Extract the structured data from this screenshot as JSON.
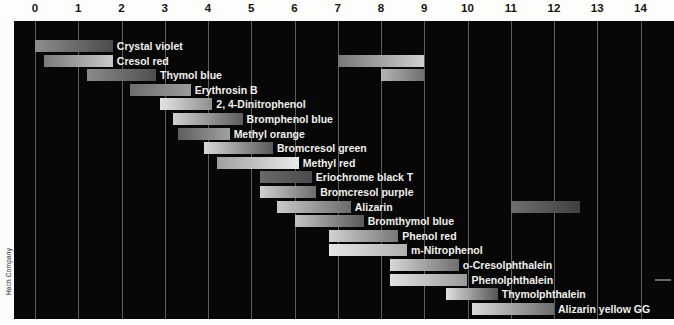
{
  "chart_data": {
    "type": "bar",
    "title": "",
    "xlabel": "pH",
    "ylabel": "",
    "xlim": [
      0,
      14.6
    ],
    "grid": true,
    "legend": false,
    "orientation": "horizontal",
    "tick_labels": [
      "0",
      "1",
      "2",
      "3",
      "4",
      "5",
      "6",
      "7",
      "8",
      "9",
      "10",
      "11",
      "12",
      "13",
      "14"
    ],
    "ticks": [
      0,
      1,
      2,
      3,
      4,
      5,
      6,
      7,
      8,
      9,
      10,
      11,
      12,
      13,
      14
    ],
    "categories": [
      "Crystal violet",
      "Cresol red",
      "Thymol blue",
      "Erythrosin B",
      "2, 4-Dinitrophenol",
      "Bromphenol blue",
      "Methyl orange",
      "Bromcresol green",
      "Methyl red",
      "Eriochrome black T",
      "Bromcresol purple",
      "Alizarin",
      "Bromthymol blue",
      "Phenol red",
      "m-Nitrophenol",
      "o-Cresolphthalein",
      "Phenolphthalein",
      "Thymolphthalein",
      "Alizarin yellow GG"
    ],
    "series": [
      {
        "name": "Crystal violet",
        "ranges": [
          [
            0.0,
            1.8
          ]
        ],
        "colors": [
          [
            "#8d8d8d",
            "#4b4b4b"
          ]
        ]
      },
      {
        "name": "Cresol red",
        "ranges": [
          [
            0.2,
            1.8
          ],
          [
            7.0,
            9.0
          ]
        ],
        "colors": [
          [
            "#7a7a7a",
            "#c9c9c9"
          ],
          [
            "#777777",
            "#cfcfcf"
          ]
        ]
      },
      {
        "name": "Thymol blue",
        "ranges": [
          [
            1.2,
            2.8
          ],
          [
            8.0,
            9.0
          ]
        ],
        "colors": [
          [
            "#8b8b8b",
            "#4f4f4f"
          ],
          [
            "#b5b5b5",
            "#6f6f6f"
          ]
        ]
      },
      {
        "name": "Erythrosin B",
        "ranges": [
          [
            2.2,
            3.6
          ]
        ],
        "colors": [
          [
            "#6e6e6e",
            "#9b9b9b"
          ]
        ]
      },
      {
        "name": "2, 4-Dinitrophenol",
        "ranges": [
          [
            2.9,
            4.1
          ]
        ],
        "colors": [
          [
            "#e4e4e4",
            "#8f8f8f"
          ]
        ]
      },
      {
        "name": "Bromphenol blue",
        "ranges": [
          [
            3.2,
            4.8
          ]
        ],
        "colors": [
          [
            "#d0d0d0",
            "#5c5c5c"
          ]
        ]
      },
      {
        "name": "Methyl orange",
        "ranges": [
          [
            3.3,
            4.5
          ]
        ],
        "colors": [
          [
            "#5e5e5e",
            "#a2a2a2"
          ]
        ]
      },
      {
        "name": "Bromcresol green",
        "ranges": [
          [
            3.9,
            5.5
          ]
        ],
        "colors": [
          [
            "#d9d9d9",
            "#585858"
          ]
        ]
      },
      {
        "name": "Methyl red",
        "ranges": [
          [
            4.2,
            6.1
          ]
        ],
        "colors": [
          [
            "#9f9f9f",
            "#e9e9e9"
          ]
        ]
      },
      {
        "name": "Eriochrome black T",
        "ranges": [
          [
            5.2,
            6.4
          ]
        ],
        "colors": [
          [
            "#6a6a6a",
            "#4a4a4a"
          ]
        ]
      },
      {
        "name": "Bromcresol purple",
        "ranges": [
          [
            5.2,
            6.5
          ]
        ],
        "colors": [
          [
            "#cfcfcf",
            "#6d6d6d"
          ]
        ]
      },
      {
        "name": "Alizarin",
        "ranges": [
          [
            5.6,
            7.3
          ],
          [
            11.0,
            12.6
          ]
        ],
        "colors": [
          [
            "#cacaca",
            "#6b6b6b"
          ],
          [
            "#6f6f6f",
            "#3f3f3f"
          ]
        ]
      },
      {
        "name": "Bromthymol blue",
        "ranges": [
          [
            6.0,
            7.6
          ]
        ],
        "colors": [
          [
            "#c3c3c3",
            "#5a5a5a"
          ]
        ]
      },
      {
        "name": "Phenol red",
        "ranges": [
          [
            6.8,
            8.4
          ]
        ],
        "colors": [
          [
            "#d2d2d2",
            "#777777"
          ]
        ]
      },
      {
        "name": "m-Nitrophenol",
        "ranges": [
          [
            6.8,
            8.6
          ]
        ],
        "colors": [
          [
            "#e6e6e6",
            "#b0b0b0"
          ]
        ]
      },
      {
        "name": "o-Cresolphthalein",
        "ranges": [
          [
            8.2,
            9.8
          ]
        ],
        "colors": [
          [
            "#d8d8d8",
            "#6e6e6e"
          ]
        ]
      },
      {
        "name": "Phenolphthalein",
        "ranges": [
          [
            8.2,
            10.0
          ]
        ],
        "colors": [
          [
            "#e2e2e2",
            "#9a9a9a"
          ]
        ]
      },
      {
        "name": "Thymolphthalein",
        "ranges": [
          [
            9.5,
            10.7
          ]
        ],
        "colors": [
          [
            "#e0e0e0",
            "#555555"
          ]
        ]
      },
      {
        "name": "Alizarin yellow GG",
        "ranges": [
          [
            10.1,
            12.0
          ]
        ],
        "colors": [
          [
            "#dadada",
            "#6c6c6c"
          ]
        ]
      }
    ]
  },
  "credit": {
    "text": "Hach Company"
  }
}
